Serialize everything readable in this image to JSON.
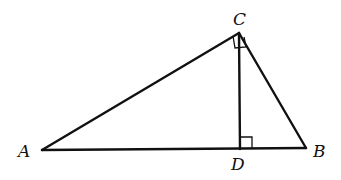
{
  "diagram": {
    "type": "right-triangle-with-altitude",
    "points": {
      "A": {
        "label": "A",
        "x": 42,
        "y": 150
      },
      "B": {
        "label": "B",
        "x": 306,
        "y": 148
      },
      "C": {
        "label": "C",
        "x": 239,
        "y": 33
      },
      "D": {
        "label": "D",
        "x": 240,
        "y": 149
      }
    },
    "segments": [
      "AB",
      "BC",
      "CA",
      "CD"
    ],
    "right_angles": [
      "ACB",
      "CDB"
    ],
    "stroke_color": "#111111"
  }
}
